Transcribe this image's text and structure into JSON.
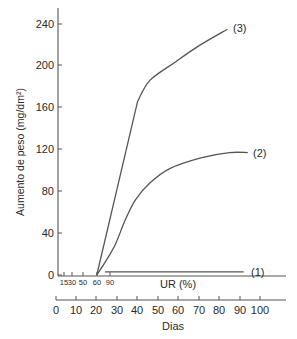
{
  "chart_data": {
    "type": "line",
    "title": "",
    "ylabel": "Aumento de peso (mg/dm²)",
    "xlabel": "Dias",
    "secondary_xlabel": "UR (%)",
    "ylim": [
      0,
      250
    ],
    "xlim": [
      0,
      110
    ],
    "grid": false,
    "legend_position": "inline labels at curve ends",
    "y_ticks": [
      0,
      40,
      80,
      120,
      160,
      200,
      240
    ],
    "x_ticks": [
      0,
      10,
      20,
      30,
      40,
      50,
      60,
      70,
      80,
      90,
      100
    ],
    "ur_ticks": [
      "15",
      "30",
      "50",
      "60",
      "90"
    ],
    "series": [
      {
        "name": "(1)",
        "x": [
          24,
          92
        ],
        "y": [
          3,
          3
        ]
      },
      {
        "name": "(2)",
        "x": [
          20,
          24,
          29,
          34,
          39,
          46,
          56,
          71,
          85,
          94
        ],
        "y": [
          0,
          12,
          29,
          53,
          72,
          88,
          102,
          112,
          117,
          117
        ]
      },
      {
        "name": "(3)",
        "x": [
          20,
          40,
          46,
          58,
          70,
          84
        ],
        "y": [
          0,
          166,
          186,
          203,
          219,
          235
        ]
      }
    ]
  },
  "labels": {
    "y_title": "Aumento de peso (mg/dm²)",
    "x_title": "Dias",
    "ur_title": "UR (%)",
    "y0": "0",
    "y40": "40",
    "y80": "80",
    "y120": "120",
    "y160": "160",
    "y200": "200",
    "y240": "240",
    "d0": "0",
    "d10": "10",
    "d20": "20",
    "d30": "30",
    "d40": "40",
    "d50": "50",
    "d60": "60",
    "d70": "70",
    "d80": "80",
    "d90": "90",
    "d100": "100",
    "ur15": "15",
    "ur30": "30",
    "ur50": "50",
    "ur60": "60",
    "ur90": "90",
    "s1": "(1)",
    "s2": "(2)",
    "s3": "(3)"
  }
}
